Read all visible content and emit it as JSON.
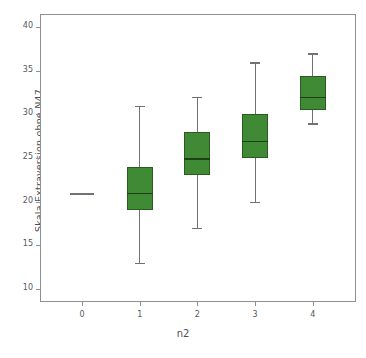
{
  "chart_data": {
    "type": "box",
    "title": "",
    "xlabel": "n2",
    "ylabel": "Skala Extraversion ohne N47",
    "categories": [
      "0",
      "1",
      "2",
      "3",
      "4"
    ],
    "ylim": [
      8.5,
      41.5
    ],
    "yticks": [
      10,
      15,
      20,
      25,
      30,
      35,
      40
    ],
    "ytick_labels": [
      "10",
      "15",
      "20",
      "25",
      "30",
      "35",
      "40"
    ],
    "grid": false,
    "legend": "none",
    "box_color": "#418A35",
    "box_edge_color": "#2c5b20",
    "whisker_color": "#6f7276",
    "frame_color": "#8d9094",
    "boxes": [
      {
        "category": "0",
        "whisker_low": 21,
        "q1": 21,
        "median": 21,
        "q3": 21,
        "whisker_high": 21,
        "degenerate": true
      },
      {
        "category": "1",
        "whisker_low": 13,
        "q1": 19,
        "median": 21,
        "q3": 24,
        "whisker_high": 31,
        "degenerate": false
      },
      {
        "category": "2",
        "whisker_low": 17,
        "q1": 23,
        "median": 25,
        "q3": 28,
        "whisker_high": 32,
        "degenerate": false
      },
      {
        "category": "3",
        "whisker_low": 20,
        "q1": 25,
        "median": 27,
        "q3": 30,
        "whisker_high": 36,
        "degenerate": false
      },
      {
        "category": "4",
        "whisker_low": 29,
        "q1": 30.5,
        "median": 32,
        "q3": 34.4,
        "whisker_high": 37,
        "degenerate": false
      }
    ]
  }
}
